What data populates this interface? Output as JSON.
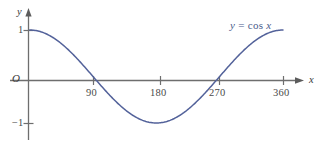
{
  "figure": {
    "background_color": "#ffffff",
    "curve_color": "#53629a",
    "axis_color": "#6e6e6e",
    "text_color": "#3f3f3f"
  },
  "axes": {
    "x_axis_label": "x",
    "y_axis_label": "y",
    "origin_label": "O",
    "x_ticks": [
      {
        "label": "90",
        "value": 90,
        "px": 93
      },
      {
        "label": "180",
        "value": 180,
        "px": 160
      },
      {
        "label": "270",
        "value": 270,
        "px": 219
      },
      {
        "label": "360",
        "value": 360,
        "px": 283
      }
    ],
    "y_ticks": [
      {
        "label": "1",
        "value": 1,
        "px": 30
      },
      {
        "label": "−1",
        "value": -1,
        "px": 123
      }
    ]
  },
  "annotations": {
    "curve_label_y": "y",
    "curve_label_eq": "=",
    "curve_label_fn": "cos",
    "curve_label_var": "x"
  },
  "chart_data": {
    "type": "line",
    "title": "",
    "subtitle": "",
    "xlabel": "x",
    "ylabel": "y",
    "xlim": [
      0,
      360
    ],
    "ylim": [
      -1,
      1
    ],
    "grid": false,
    "legend": "inline-annotation",
    "legend_position": "top-right",
    "xticks": [
      90,
      180,
      270,
      360
    ],
    "xticklabels": [
      "90",
      "180",
      "270",
      "360"
    ],
    "yticks": [
      -1,
      1
    ],
    "yticklabels": [
      "1",
      "−1"
    ],
    "series": [
      {
        "name": "y = cos x",
        "color": "#53629a",
        "x": [
          0,
          10,
          20,
          30,
          40,
          50,
          60,
          70,
          80,
          90,
          100,
          110,
          120,
          130,
          140,
          150,
          160,
          170,
          180,
          190,
          200,
          210,
          220,
          230,
          240,
          250,
          260,
          270,
          280,
          290,
          300,
          310,
          320,
          330,
          340,
          350,
          360
        ],
        "values": [
          1.0,
          0.985,
          0.94,
          0.866,
          0.766,
          0.643,
          0.5,
          0.342,
          0.174,
          0.0,
          -0.174,
          -0.342,
          -0.5,
          -0.643,
          -0.766,
          -0.866,
          -0.94,
          -0.985,
          -1.0,
          -0.985,
          -0.94,
          -0.866,
          -0.766,
          -0.643,
          -0.5,
          -0.342,
          -0.174,
          0.0,
          0.174,
          0.342,
          0.5,
          0.643,
          0.766,
          0.866,
          0.94,
          0.985,
          1.0
        ]
      }
    ],
    "zero_crossings": [
      90,
      270
    ],
    "maxima": [
      {
        "x": 0,
        "y": 1
      },
      {
        "x": 360,
        "y": 1
      }
    ],
    "minima": [
      {
        "x": 180,
        "y": -1
      }
    ]
  }
}
